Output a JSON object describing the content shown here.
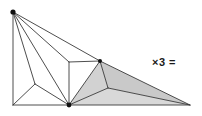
{
  "figure": {
    "annotation": "×3 =",
    "background_color": "#ffffff",
    "line_color": "#3a3a3a",
    "shade_color": "#d2d2d2",
    "vertex_color": "#111111",
    "vertices": {
      "apex": [
        13,
        12
      ],
      "bottom_left": [
        13,
        105
      ],
      "bottom_center": [
        69,
        105
      ],
      "bottom_right": [
        190,
        105
      ],
      "left_mid": [
        35,
        84
      ],
      "upper_mid": [
        69,
        62
      ],
      "ridge_top": [
        100,
        61
      ],
      "inner_center": [
        108,
        88
      ]
    },
    "edges": [
      {
        "name": "apex-to-bottom-left",
        "from": "apex",
        "to": "bottom_left",
        "shaded": false
      },
      {
        "name": "apex-to-left-mid",
        "from": "apex",
        "to": "left_mid",
        "shaded": false
      },
      {
        "name": "apex-to-bottom-center",
        "from": "apex",
        "to": "bottom_center",
        "shaded": false
      },
      {
        "name": "apex-to-upper-mid",
        "from": "apex",
        "to": "upper_mid",
        "shaded": false
      },
      {
        "name": "apex-to-ridge-top",
        "from": "apex",
        "to": "ridge_top",
        "shaded": false
      },
      {
        "name": "bottom-left-to-bottom-center",
        "from": "bottom_left",
        "to": "bottom_center",
        "shaded": false
      },
      {
        "name": "bottom-center-to-bottom-right",
        "from": "bottom_center",
        "to": "bottom_right",
        "shaded": true
      },
      {
        "name": "left-mid-to-bottom-left",
        "from": "left_mid",
        "to": "bottom_left",
        "shaded": false
      },
      {
        "name": "left-mid-to-bottom-center",
        "from": "left_mid",
        "to": "bottom_center",
        "shaded": false
      },
      {
        "name": "upper-mid-to-bottom-center",
        "from": "upper_mid",
        "to": "bottom_center",
        "shaded": false
      },
      {
        "name": "upper-mid-to-ridge-top",
        "from": "upper_mid",
        "to": "ridge_top",
        "shaded": false
      },
      {
        "name": "ridge-top-to-bottom-center",
        "from": "ridge_top",
        "to": "bottom_center",
        "shaded": true
      },
      {
        "name": "ridge-top-to-inner-center",
        "from": "ridge_top",
        "to": "inner_center",
        "shaded": true
      },
      {
        "name": "ridge-top-to-bottom-right",
        "from": "ridge_top",
        "to": "bottom_right",
        "shaded": true
      },
      {
        "name": "inner-center-to-bottom-center",
        "from": "inner_center",
        "to": "bottom_center",
        "shaded": true
      },
      {
        "name": "inner-center-to-bottom-right",
        "from": "inner_center",
        "to": "bottom_right",
        "shaded": true
      }
    ],
    "shaded_faces": [
      {
        "name": "face-ridge-inner-bottomcenter",
        "points": "69,105 100,61 108,88"
      },
      {
        "name": "face-ridge-inner-bottomright",
        "points": "100,61 190,105 108,88"
      },
      {
        "name": "face-inner-bottomcenter-bottomright",
        "points": "69,105 108,88 190,105"
      }
    ],
    "marked_vertices": [
      "apex",
      "bottom_center",
      "ridge_top"
    ]
  }
}
